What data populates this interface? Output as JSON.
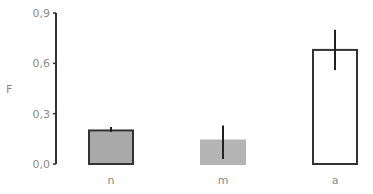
{
  "chart_data": {
    "type": "bar",
    "title": "",
    "xlabel": "",
    "ylabel": "F",
    "ylim": [
      0,
      0.9
    ],
    "yticks": [
      "0,0",
      "0,3",
      "0,6",
      "0,9"
    ],
    "ytick_values": [
      0.0,
      0.3,
      0.6,
      0.9
    ],
    "categories": [
      "n",
      "m",
      "a"
    ],
    "values": [
      0.2,
      0.14,
      0.68
    ],
    "error_bars": [
      {
        "low": 0.19,
        "high": 0.22
      },
      {
        "low": 0.03,
        "high": 0.23
      },
      {
        "low": 0.56,
        "high": 0.8
      }
    ],
    "bar_fills": [
      "#a9a9a9",
      "#b4b4b4",
      "#ffffff"
    ],
    "bar_outlines": [
      "#333333",
      "#b4b4b4",
      "#333333"
    ],
    "grid": false,
    "legend": null
  },
  "colors": {
    "axis": "#333333",
    "text": "#8a8a8a",
    "error_bar": "#222222"
  }
}
